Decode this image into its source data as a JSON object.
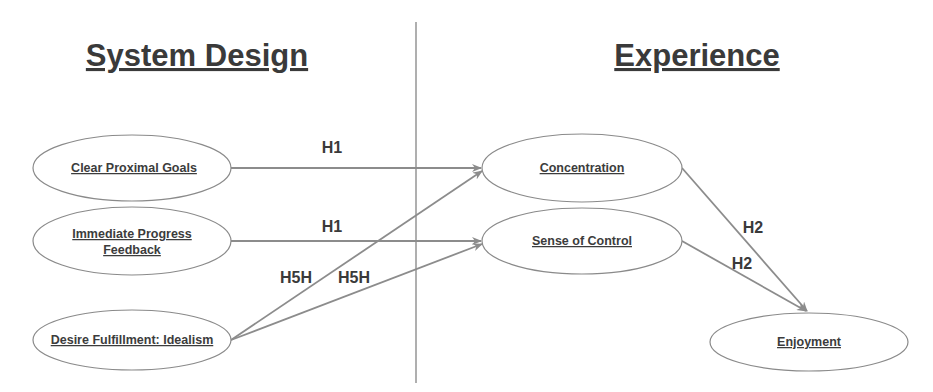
{
  "sections": {
    "left_title": "System Design",
    "right_title": "Experience"
  },
  "colors": {
    "text": "#3a3a3a",
    "lines": "#8c8c8c",
    "node_border": "#8a8a8a",
    "background": "#ffffff"
  },
  "nodes": {
    "clear_proximal_goals": {
      "label": "Clear Proximal Goals"
    },
    "immediate_progress_feedback": {
      "label_line1": "Immediate Progress",
      "label_line2": "Feedback"
    },
    "desire_fulfillment": {
      "label": "Desire Fulfillment: Idealism"
    },
    "concentration": {
      "label": "Concentration"
    },
    "sense_of_control": {
      "label": "Sense of Control"
    },
    "enjoyment": {
      "label": "Enjoyment"
    }
  },
  "edges": [
    {
      "from": "Clear Proximal Goals",
      "to": "Concentration",
      "label": "H1"
    },
    {
      "from": "Immediate Progress Feedback",
      "to": "Sense of Control",
      "label": "H1"
    },
    {
      "from": "Desire Fulfillment: Idealism",
      "to": "Concentration",
      "label": "H5H"
    },
    {
      "from": "Desire Fulfillment: Idealism",
      "to": "Sense of Control",
      "label": "H5H"
    },
    {
      "from": "Concentration",
      "to": "Enjoyment",
      "label": "H2"
    },
    {
      "from": "Sense of Control",
      "to": "Enjoyment",
      "label": "H2"
    }
  ]
}
